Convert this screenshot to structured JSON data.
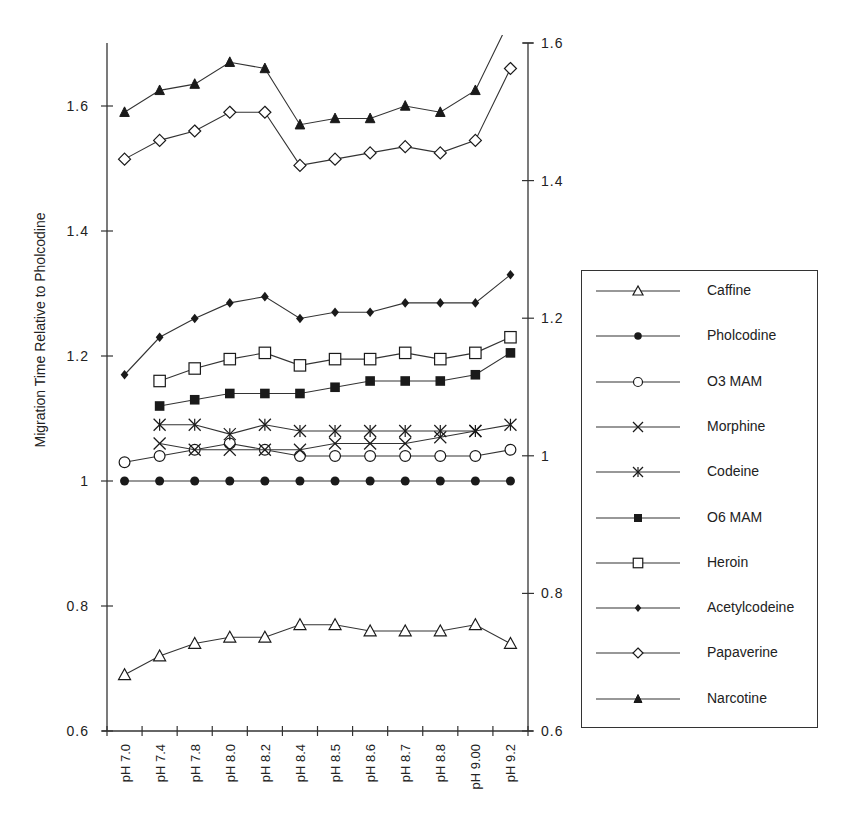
{
  "chart_data": {
    "type": "line",
    "title": "",
    "xlabel": "",
    "ylabel": "Migration Time Relative to Pholcodine",
    "categories": [
      "pH 7.0",
      "pH 7.4",
      "pH 7.8",
      "pH 8.0",
      "pH 8.2",
      "pH 8.4",
      "pH 8.5",
      "pH 8.6",
      "pH 8.7",
      "pH 8.8",
      "pH 9.00",
      "pH 9.2"
    ],
    "ylim": [
      0.6,
      1.7
    ],
    "yticks": [
      "0.6",
      "0.8",
      "1",
      "1.2",
      "1.4",
      "1.6"
    ],
    "ytick_values": [
      0.6,
      0.8,
      1.0,
      1.2,
      1.4,
      1.6
    ],
    "y2lim": [
      0.6,
      1.6
    ],
    "y2ticks": [
      "0.6",
      "0.8",
      "1",
      "1.2",
      "1.4",
      "1.6"
    ],
    "y2tick_values": [
      0.6,
      0.8,
      1.0,
      1.2,
      1.4,
      1.6
    ],
    "grid": false,
    "legend_position": "right",
    "series": [
      {
        "name": "Caffine",
        "marker": "triangle-open",
        "values": [
          0.69,
          0.72,
          0.74,
          0.75,
          0.75,
          0.77,
          0.77,
          0.76,
          0.76,
          0.76,
          0.77,
          0.74
        ]
      },
      {
        "name": "Pholcodine",
        "marker": "circle-filled",
        "values": [
          1.0,
          1.0,
          1.0,
          1.0,
          1.0,
          1.0,
          1.0,
          1.0,
          1.0,
          1.0,
          1.0,
          1.0
        ]
      },
      {
        "name": "O3 MAM",
        "marker": "circle-open",
        "values": [
          1.03,
          1.04,
          1.05,
          1.06,
          1.05,
          1.04,
          1.04,
          1.04,
          1.04,
          1.04,
          1.04,
          1.05
        ]
      },
      {
        "name": "Morphine",
        "marker": "x",
        "values": [
          null,
          1.06,
          1.05,
          1.05,
          1.05,
          1.05,
          1.06,
          1.06,
          1.06,
          1.07,
          1.08,
          null
        ]
      },
      {
        "name": "Codeine",
        "marker": "asterisk",
        "values": [
          null,
          1.09,
          1.09,
          1.075,
          1.09,
          1.08,
          1.08,
          1.08,
          1.08,
          1.08,
          1.08,
          1.09
        ]
      },
      {
        "name": "O6 MAM",
        "marker": "square-filled",
        "values": [
          null,
          1.12,
          1.13,
          1.14,
          1.14,
          1.14,
          1.15,
          1.16,
          1.16,
          1.16,
          1.17,
          1.205
        ]
      },
      {
        "name": "Heroin",
        "marker": "square-open",
        "values": [
          null,
          1.16,
          1.18,
          1.195,
          1.205,
          1.185,
          1.195,
          1.195,
          1.205,
          1.195,
          1.205,
          1.23
        ]
      },
      {
        "name": "Acetylcodeine",
        "marker": "diamond-filled",
        "values": [
          1.17,
          1.23,
          1.26,
          1.285,
          1.295,
          1.26,
          1.27,
          1.27,
          1.285,
          1.285,
          1.285,
          1.33
        ]
      },
      {
        "name": "Papaverine",
        "marker": "diamond-open",
        "values": [
          1.515,
          1.545,
          1.56,
          1.59,
          1.59,
          1.505,
          1.515,
          1.525,
          1.535,
          1.525,
          1.545,
          1.66
        ]
      },
      {
        "name": "Narcotine",
        "marker": "triangle-filled",
        "values": [
          1.59,
          1.625,
          1.635,
          1.67,
          1.66,
          1.57,
          1.58,
          1.58,
          1.6,
          1.59,
          1.625,
          1.74
        ]
      }
    ]
  },
  "legend": {
    "items": [
      {
        "label": "Caffine",
        "marker": "triangle-open"
      },
      {
        "label": "Pholcodine",
        "marker": "circle-filled"
      },
      {
        "label": "O3 MAM",
        "marker": "circle-open"
      },
      {
        "label": "Morphine",
        "marker": "x"
      },
      {
        "label": "Codeine",
        "marker": "asterisk"
      },
      {
        "label": "O6 MAM",
        "marker": "square-filled"
      },
      {
        "label": "Heroin",
        "marker": "square-open"
      },
      {
        "label": "Acetylcodeine",
        "marker": "diamond-filled"
      },
      {
        "label": "Papaverine",
        "marker": "diamond-open"
      },
      {
        "label": "Narcotine",
        "marker": "triangle-filled"
      }
    ]
  },
  "style": {
    "line_color": "#333333",
    "marker_color": "#1a1a1a",
    "background": "#ffffff"
  }
}
